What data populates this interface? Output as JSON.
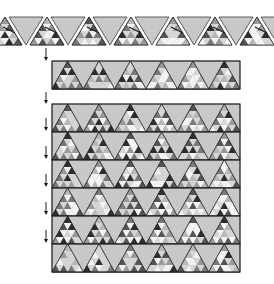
{
  "figure": {
    "colors": {
      "background": "#ffffff",
      "down_triangle": "#c8c8c8",
      "outline": "#222222",
      "shades": [
        "#2e2e2e",
        "#555555",
        "#7a7a7a",
        "#9a9a9a",
        "#b8b8b8",
        "#d6d6d6",
        "#f4f4f4"
      ],
      "arrow": "#1a1a1a"
    },
    "top_band": {
      "y": 17,
      "height": 28,
      "tile_width": 34,
      "gap": 4,
      "start_x": -12,
      "count_up": 7,
      "count_down": 7,
      "arrows_between": true
    },
    "single_strip": {
      "x": 52,
      "y": 61,
      "width": 188,
      "height": 28,
      "triangles": 6
    },
    "block": {
      "x": 52,
      "y": 104,
      "width": 188,
      "row_height": 28,
      "rows": 6,
      "triangles_per_row": 6
    },
    "down_arrows": {
      "x": 46,
      "ys": [
        [
          48,
          61
        ],
        [
          92,
          104
        ],
        [
          118,
          131
        ],
        [
          146,
          159
        ],
        [
          174,
          187
        ],
        [
          202,
          215
        ],
        [
          230,
          243
        ]
      ]
    }
  }
}
